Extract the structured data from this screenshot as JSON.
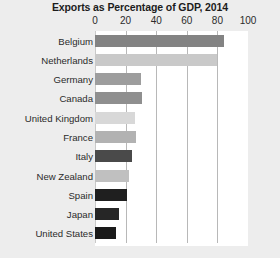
{
  "chart_data": {
    "type": "bar",
    "orientation": "horizontal",
    "title": "Exports as Percentage of GDP, 2014",
    "xlabel": "",
    "ylabel": "",
    "xlim": [
      0,
      100
    ],
    "xticks": [
      0,
      20,
      40,
      60,
      80,
      100
    ],
    "xtick_labels": [
      "0",
      "20",
      "40",
      "60",
      "80",
      "100"
    ],
    "grid": "vertical",
    "axis_position": "top",
    "legend": "none",
    "categories": [
      "Belgium",
      "Netherlands",
      "Germany",
      "Canada",
      "United Kingdom",
      "France",
      "Italy",
      "New Zealand",
      "Spain",
      "Japan",
      "United States"
    ],
    "values": [
      84,
      80,
      30,
      31,
      26,
      27,
      24,
      22,
      21,
      16,
      14
    ],
    "bar_colors": [
      "#838383",
      "#c9c9c9",
      "#9d9d9d",
      "#8f8f8f",
      "#d8d8d8",
      "#b2b2b2",
      "#4a4a4a",
      "#c0c0c0",
      "#1f1f1f",
      "#262626",
      "#1a1a1a"
    ],
    "bars": [
      {
        "label": "Belgium",
        "value": 84,
        "color": "#838383"
      },
      {
        "label": "Netherlands",
        "value": 80,
        "color": "#c9c9c9"
      },
      {
        "label": "Germany",
        "value": 30,
        "color": "#9d9d9d"
      },
      {
        "label": "Canada",
        "value": 31,
        "color": "#8f8f8f"
      },
      {
        "label": "United Kingdom",
        "value": 26,
        "color": "#d8d8d8"
      },
      {
        "label": "France",
        "value": 27,
        "color": "#b2b2b2"
      },
      {
        "label": "Italy",
        "value": 24,
        "color": "#4a4a4a"
      },
      {
        "label": "New Zealand",
        "value": 22,
        "color": "#c0c0c0"
      },
      {
        "label": "Spain",
        "value": 21,
        "color": "#1f1f1f"
      },
      {
        "label": "Japan",
        "value": 16,
        "color": "#262626"
      },
      {
        "label": "United States",
        "value": 14,
        "color": "#1a1a1a"
      }
    ]
  },
  "style": {
    "background": "#ededed",
    "plot_background": "#ffffff",
    "gridline_color": "#b8b8b8",
    "text_color": "#2b2b2b",
    "title_color": "#1c1c1c"
  }
}
